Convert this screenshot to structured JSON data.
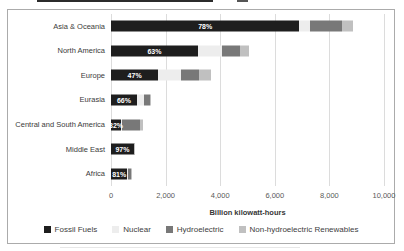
{
  "chart_data": {
    "type": "bar",
    "orientation": "horizontal",
    "stacked": true,
    "title": "",
    "xlabel": "Billion kilowatt-hours",
    "xlim": [
      0,
      10000
    ],
    "x_ticks": [
      "0",
      "2,000",
      "4,000",
      "6,000",
      "8,000",
      "10,000"
    ],
    "grid": "vertical",
    "legend_position": "bottom",
    "categories": [
      "Asia & Oceania",
      "North America",
      "Europe",
      "Eurasia",
      "Central and South America",
      "Middle East",
      "Africa"
    ],
    "bar_labels": [
      "78%",
      "63%",
      "47%",
      "66%",
      "32%",
      "97%",
      "81%"
    ],
    "series": [
      {
        "name": "Fossil Fuels",
        "color": "#1e1e1e",
        "values": [
          6900,
          3180,
          1730,
          950,
          370,
          835,
          600
        ]
      },
      {
        "name": "Nuclear",
        "color": "#ededed",
        "values": [
          400,
          880,
          840,
          260,
          25,
          0,
          13
        ]
      },
      {
        "name": "Hydroelectric",
        "color": "#787878",
        "values": [
          1150,
          660,
          640,
          225,
          660,
          20,
          105
        ]
      },
      {
        "name": "Non-hydroelectric Renewables",
        "color": "#c0c0c0",
        "values": [
          400,
          330,
          470,
          5,
          100,
          5,
          22
        ]
      }
    ]
  }
}
